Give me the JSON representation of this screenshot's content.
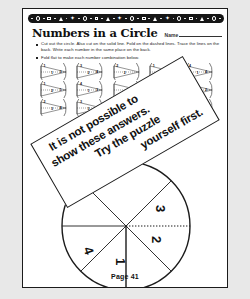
{
  "page": {
    "title": "Numbers in a Circle",
    "name_label": "Name",
    "footer": "Page 41",
    "ink_color": "#111111",
    "paper_color": "#ffffff",
    "background_color": "#e8e8e8"
  },
  "decorative_band": {
    "color": "#161616",
    "motif_sequence": [
      "dot",
      "circle",
      "dot",
      "square",
      "dot",
      "triangle",
      "dot",
      "star"
    ],
    "repeat_count": 4
  },
  "instructions": [
    "Cut out the circle.  Also cut on the solid line.  Fold on the dashed lines. Trace the lines on the back.  Write each number in the same place on the back.",
    "Fold flat to make each number combination below."
  ],
  "fan_grid": {
    "columns": 5,
    "rows": 3,
    "items": [
      {
        "top": "1",
        "mid": "1",
        "right": "3"
      },
      {
        "top": "3",
        "mid": "2",
        "right": "4"
      },
      {
        "top": "2",
        "mid": "2",
        "right": ""
      },
      {
        "top": "1",
        "mid": "",
        "right": "4"
      },
      {
        "top": "4",
        "mid": "1",
        "right": "4"
      },
      {
        "top": "1",
        "mid": "2",
        "right": "1"
      },
      {
        "top": "4",
        "mid": "1",
        "right": "3"
      },
      {
        "top": "",
        "mid": "",
        "right": ""
      },
      {
        "top": "",
        "mid": "",
        "right": ""
      },
      {
        "top": "1",
        "mid": "1",
        "right": "2"
      },
      {
        "top": "2",
        "mid": "3",
        "right": "4"
      },
      {
        "top": "3",
        "mid": "3",
        "right": ""
      },
      {
        "top": "",
        "mid": "",
        "right": ""
      },
      {
        "top": "",
        "mid": "",
        "right": ""
      },
      {
        "top": "",
        "mid": "",
        "right": "2"
      }
    ]
  },
  "answer_overlay": {
    "lines": [
      "It is not possible to",
      "show these answers.",
      "Try the puzzle",
      "yourself first."
    ],
    "rotation_deg": -30
  },
  "big_circle": {
    "sectors": [
      {
        "label": "3"
      },
      {
        "label": "2"
      },
      {
        "label": "1"
      },
      {
        "label": "4"
      }
    ],
    "has_dotted_fold_line": true,
    "has_solid_cut_line": true
  }
}
